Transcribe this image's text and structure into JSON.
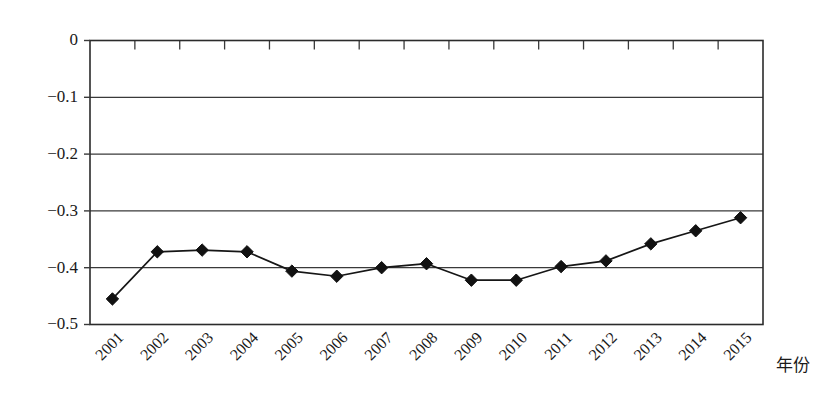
{
  "chart_data": {
    "type": "line",
    "title": "",
    "subtitle": "",
    "xlabel": "年份",
    "ylabel": "",
    "categories": [
      "2001",
      "2002",
      "2003",
      "2004",
      "2005",
      "2006",
      "2007",
      "2008",
      "2009",
      "2010",
      "2011",
      "2012",
      "2013",
      "2014",
      "2015"
    ],
    "values": [
      -0.455,
      -0.372,
      -0.369,
      -0.372,
      -0.406,
      -0.415,
      -0.4,
      -0.393,
      -0.422,
      -0.422,
      -0.398,
      -0.388,
      -0.358,
      -0.335,
      -0.312
    ],
    "series": [
      {
        "name": "series-1",
        "values": [
          -0.455,
          -0.372,
          -0.369,
          -0.372,
          -0.406,
          -0.415,
          -0.4,
          -0.393,
          -0.422,
          -0.422,
          -0.398,
          -0.388,
          -0.358,
          -0.335,
          -0.312
        ],
        "marker": "diamond",
        "color": "#111111"
      }
    ],
    "ylim": [
      -0.5,
      0
    ],
    "xlim": [
      "2001",
      "2015"
    ],
    "ytick_labels": [
      "0",
      "−0.1",
      "−0.2",
      "−0.3",
      "−0.4",
      "−0.5"
    ],
    "ytick_values": [
      0,
      -0.1,
      -0.2,
      -0.3,
      -0.4,
      -0.5
    ],
    "grid": true,
    "grid_axis": "y",
    "legend": false,
    "legend_position": "none",
    "xtick_rotation": -45,
    "top_axis_ticks": true,
    "background_color": "#ffffff",
    "axis_color": "#2b2b2b"
  },
  "axis": {
    "x_title": "年份"
  }
}
